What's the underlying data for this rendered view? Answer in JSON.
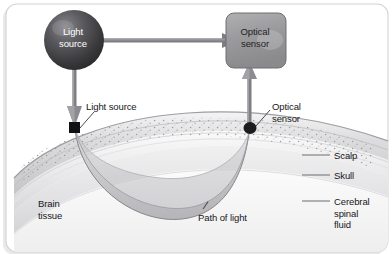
{
  "figure": {
    "type": "diagram",
    "nodes": {
      "light_source": {
        "label": "Light\nsource",
        "shape": "sphere",
        "fill": "#4a4a4d",
        "text_color": "#ffffff"
      },
      "optical_sensor": {
        "label": "Optical\nsensor",
        "shape": "rounded-rect",
        "fill": "#9a9a9d",
        "text_color": "#1d1d1f"
      }
    },
    "callouts": [
      {
        "name": "light-source-callout",
        "text": "Light source"
      },
      {
        "name": "optical-sensor-callout",
        "text": "Optical\nsensor"
      },
      {
        "name": "path-of-light-callout",
        "text": "Path of light"
      }
    ],
    "region_labels": [
      {
        "name": "brain-tissue",
        "text": "Brain\ntissue"
      }
    ],
    "layer_labels": [
      {
        "name": "scalp",
        "text": "Scalp"
      },
      {
        "name": "skull",
        "text": "Skull"
      },
      {
        "name": "cerebral-spinal-fluid",
        "text": "Cerebral\nspinal\nfluid"
      }
    ],
    "arrows": [
      {
        "name": "source-to-sensor-arrow",
        "direction": "right"
      },
      {
        "name": "source-to-scalp-arrow",
        "direction": "down"
      },
      {
        "name": "scalp-to-sensor-arrow",
        "direction": "up"
      }
    ],
    "colors": {
      "arrow": "#7b7b7e",
      "border": "#d3d3d5",
      "text": "#17171a",
      "scalp": "#d8d8da",
      "skull": "#e8e8ea",
      "csf": "#dedee0",
      "brain": "#f2f2f3",
      "light_path": "#c9c9cb",
      "marker": "#111113"
    }
  }
}
